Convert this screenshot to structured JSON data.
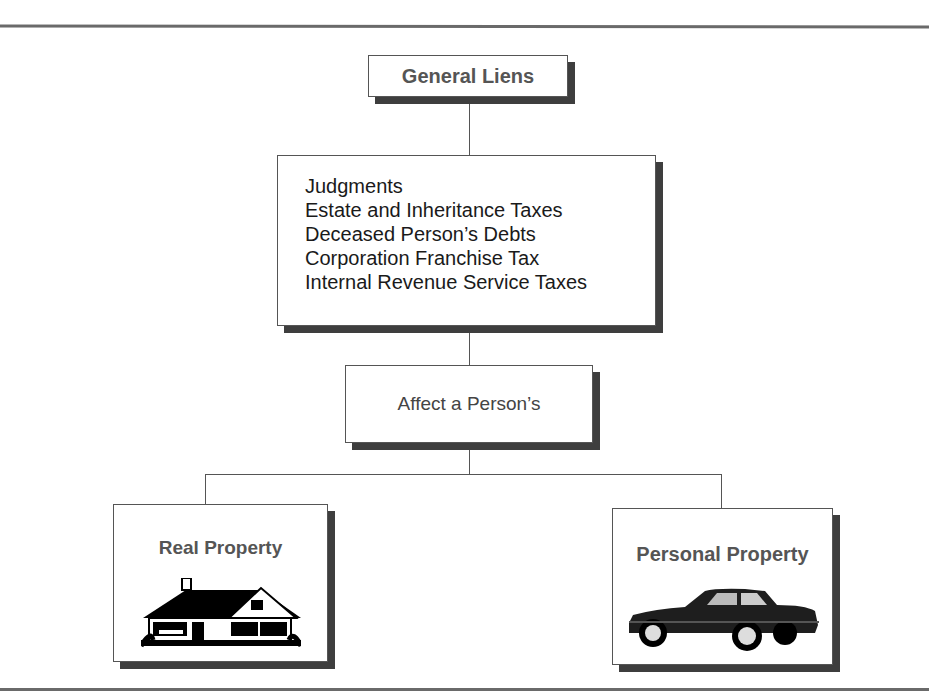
{
  "diagram": {
    "root": {
      "label": "General Liens"
    },
    "liens_list": {
      "items": [
        "Judgments",
        "Estate and Inheritance Taxes",
        "Deceased Person’s Debts",
        "Corporation Franchise Tax",
        "Internal Revenue Service Taxes"
      ]
    },
    "connector": {
      "label": "Affect a Person’s"
    },
    "children": [
      {
        "label": "Real Property",
        "icon": "house-icon"
      },
      {
        "label": "Personal Property",
        "icon": "car-icon"
      }
    ]
  }
}
